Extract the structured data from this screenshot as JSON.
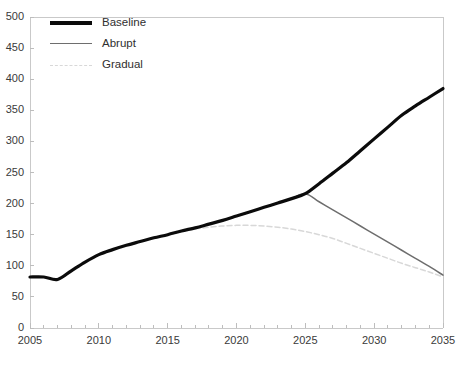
{
  "chart_data": {
    "type": "line",
    "title": "",
    "subtitle": "",
    "xlabel": "",
    "ylabel": "",
    "xlim": [
      2005,
      2035
    ],
    "ylim": [
      0,
      500
    ],
    "grid": false,
    "legend_position": "top-left",
    "xticks": [
      "2005",
      "2010",
      "2015",
      "2020",
      "2025",
      "2030",
      "2035"
    ],
    "xtick_values": [
      2005,
      2010,
      2015,
      2020,
      2025,
      2030,
      2035
    ],
    "yticks": [
      "0",
      "50",
      "100",
      "150",
      "200",
      "250",
      "300",
      "350",
      "400",
      "450",
      "500"
    ],
    "ytick_values": [
      0,
      50,
      100,
      150,
      200,
      250,
      300,
      350,
      400,
      450,
      500
    ],
    "minor_xtick_interval": 1,
    "x": [
      2005,
      2006,
      2007,
      2008,
      2009,
      2010,
      2011,
      2012,
      2013,
      2014,
      2015,
      2016,
      2017,
      2018,
      2019,
      2020,
      2021,
      2022,
      2023,
      2024,
      2025,
      2026,
      2027,
      2028,
      2029,
      2030,
      2031,
      2032,
      2033,
      2034,
      2035
    ],
    "series": [
      {
        "name": "Baseline",
        "color": "#0b0b0b",
        "style": "solid",
        "width": 3.2,
        "values": [
          82,
          82,
          78,
          92,
          106,
          118,
          126,
          133,
          139,
          145,
          150,
          156,
          161,
          167,
          173,
          180,
          187,
          194,
          201,
          208,
          216,
          232,
          249,
          266,
          285,
          304,
          323,
          342,
          357,
          371,
          385
        ]
      },
      {
        "name": "Abrupt",
        "color": "#6e6e6e",
        "style": "solid",
        "width": 1.5,
        "values": [
          82,
          82,
          78,
          92,
          106,
          118,
          126,
          133,
          139,
          145,
          150,
          156,
          161,
          167,
          173,
          180,
          187,
          194,
          201,
          208,
          216,
          203,
          190,
          177,
          164,
          151,
          138,
          125,
          112,
          99,
          85
        ]
      },
      {
        "name": "Gradual",
        "color": "#d8d8d8",
        "style": "dashed",
        "width": 1.5,
        "values": [
          82,
          82,
          78,
          92,
          106,
          118,
          126,
          133,
          139,
          145,
          150,
          155,
          159,
          162,
          164,
          165,
          165,
          164,
          162,
          159,
          155,
          150,
          144,
          136,
          128,
          120,
          112,
          104,
          97,
          90,
          82
        ]
      }
    ]
  },
  "legend": {
    "items": [
      {
        "label": "Baseline"
      },
      {
        "label": "Abrupt"
      },
      {
        "label": "Gradual"
      }
    ]
  },
  "axes": {
    "frame_color": "#c9c9c9",
    "tick_color": "#bdbdbd",
    "label_color": "#3a3a3a"
  }
}
